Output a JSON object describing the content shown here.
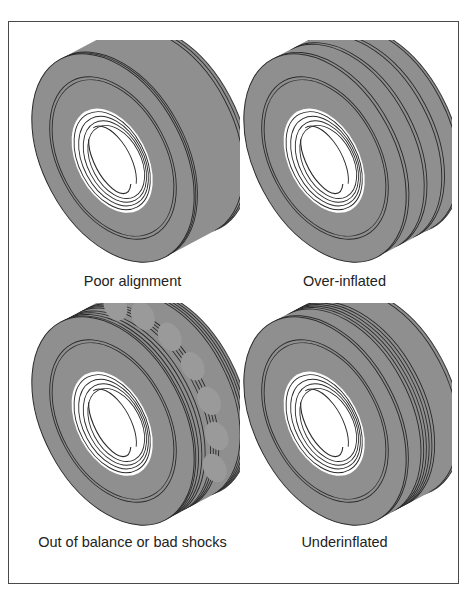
{
  "figure": {
    "colors": {
      "rubber": "#8f8f8f",
      "line": "#2a2a2a",
      "rim": "#ffffff",
      "patch": "#9a9a9a",
      "frame": "#4a4a4a"
    },
    "panels": [
      {
        "id": "poor-alignment",
        "label": "Poor alignment",
        "pattern": "edge-wear",
        "tread_grooves": [
          0.0,
          0.05,
          0.1,
          0.94,
          0.97
        ],
        "patches": 0
      },
      {
        "id": "over-inflated",
        "label": "Over-inflated",
        "pattern": "center-wear",
        "tread_grooves": [
          0.0,
          0.04,
          0.3,
          0.35,
          0.62,
          0.67,
          0.95
        ],
        "patches": 0
      },
      {
        "id": "out-of-balance",
        "label": "Out of balance or bad shocks",
        "pattern": "cupping",
        "tread_grooves": [
          0.0,
          0.04,
          0.08,
          0.12,
          0.16,
          0.55,
          0.6,
          0.65,
          0.7,
          0.8,
          0.86,
          0.92,
          0.97
        ],
        "patches": 7
      },
      {
        "id": "underinflated",
        "label": "Underinflated",
        "pattern": "shoulder-wear",
        "tread_grooves": [
          0.0,
          0.05,
          0.48,
          0.53,
          0.58,
          0.63,
          0.68,
          0.73,
          0.96
        ],
        "patches": 0
      }
    ]
  }
}
